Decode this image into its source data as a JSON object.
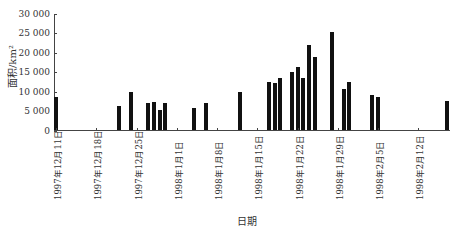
{
  "chart_data": {
    "type": "bar",
    "title": "",
    "xlabel": "日期",
    "ylabel": "面积/km²",
    "ylim": [
      0,
      30000
    ],
    "yticks": [
      "0",
      "5 000",
      "10 000",
      "15 000",
      "20 000",
      "25 000",
      "30 000"
    ],
    "xtick_labels": [
      "1997年12月11日",
      "1997年12月18日",
      "1997年12月25日",
      "1998年1月1日",
      "1998年1月8日",
      "1998年1月15日",
      "1998年1月22日",
      "1998年1月29日",
      "1998年2月5日",
      "1998年2月12日"
    ],
    "grid": false,
    "legend": null,
    "bars": [
      {
        "day_offset": 0,
        "date": "1997-12-11",
        "value": 8700
      },
      {
        "day_offset": 11,
        "date": "1997-12-22",
        "value": 6400
      },
      {
        "day_offset": 13,
        "date": "1997-12-24",
        "value": 9800
      },
      {
        "day_offset": 16,
        "date": "1997-12-27",
        "value": 7000
      },
      {
        "day_offset": 17,
        "date": "1997-12-28",
        "value": 7400
      },
      {
        "day_offset": 18,
        "date": "1997-12-29",
        "value": 5300
      },
      {
        "day_offset": 19,
        "date": "1997-12-30",
        "value": 7000
      },
      {
        "day_offset": 24,
        "date": "1998-01-04",
        "value": 5800
      },
      {
        "day_offset": 26,
        "date": "1998-01-06",
        "value": 7100
      },
      {
        "day_offset": 32,
        "date": "1998-01-12",
        "value": 10000
      },
      {
        "day_offset": 37,
        "date": "1998-01-17",
        "value": 12500
      },
      {
        "day_offset": 38,
        "date": "1998-01-18",
        "value": 12300
      },
      {
        "day_offset": 39,
        "date": "1998-01-19",
        "value": 13500
      },
      {
        "day_offset": 41,
        "date": "1998-01-21",
        "value": 15100
      },
      {
        "day_offset": 42,
        "date": "1998-01-22",
        "value": 16300
      },
      {
        "day_offset": 43,
        "date": "1998-01-23",
        "value": 13500
      },
      {
        "day_offset": 44,
        "date": "1998-01-24",
        "value": 22000
      },
      {
        "day_offset": 45,
        "date": "1998-01-25",
        "value": 18900
      },
      {
        "day_offset": 48,
        "date": "1998-01-28",
        "value": 25300
      },
      {
        "day_offset": 50,
        "date": "1998-01-30",
        "value": 10700
      },
      {
        "day_offset": 51,
        "date": "1998-01-31",
        "value": 12500
      },
      {
        "day_offset": 55,
        "date": "1998-02-04",
        "value": 9200
      },
      {
        "day_offset": 56,
        "date": "1998-02-05",
        "value": 8500
      },
      {
        "day_offset": 68,
        "date": "1998-02-17",
        "value": 7600
      }
    ]
  }
}
